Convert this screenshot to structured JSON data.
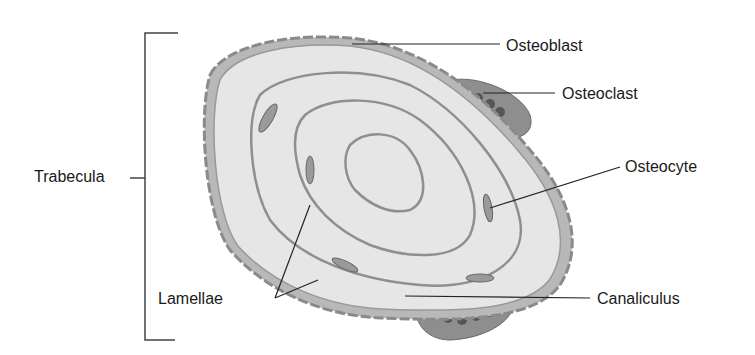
{
  "diagram": {
    "labels": {
      "trabecula": "Trabecula",
      "osteoblast": "Osteoblast",
      "osteoclast": "Osteoclast",
      "osteocyte": "Osteocyte",
      "lamellae": "Lamellae",
      "canaliculus": "Canaliculus"
    },
    "colors": {
      "bone_fill": "#e6e6e6",
      "cell_fill": "#a8a8a8",
      "lines": "#333333",
      "text": "#1a1a1a"
    }
  }
}
